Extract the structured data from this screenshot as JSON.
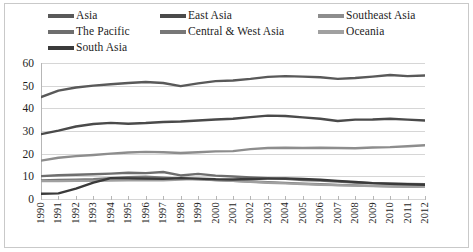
{
  "legend": {
    "position": "top",
    "items": [
      {
        "label": "Asia",
        "color": "#595959"
      },
      {
        "label": "East Asia",
        "color": "#4a4a4a"
      },
      {
        "label": "Southeast Asia",
        "color": "#8d8d8d"
      },
      {
        "label": "The Pacific",
        "color": "#6e6e6e"
      },
      {
        "label": "Central & West Asia",
        "color": "#777777"
      },
      {
        "label": "Oceania",
        "color": "#a0a0a0"
      },
      {
        "label": "South Asia",
        "color": "#3a3a3a"
      }
    ]
  },
  "axes": {
    "y_ticks": [
      "0",
      "10",
      "20",
      "30",
      "40",
      "50",
      "60"
    ],
    "x_ticks": [
      "1990",
      "1991",
      "1992",
      "1993",
      "1994",
      "1995",
      "1996",
      "1997",
      "1998",
      "1999",
      "2000",
      "2001",
      "2002",
      "2003",
      "2004",
      "2005",
      "2006",
      "2007",
      "2008",
      "2009",
      "2010",
      "2011",
      "2012"
    ]
  },
  "chart_data": {
    "type": "line",
    "title": "",
    "subtitle": "",
    "xlabel": "",
    "ylabel": "",
    "xlim": [
      1990,
      2012
    ],
    "ylim": [
      0,
      60
    ],
    "grid": true,
    "legend_position": "top",
    "categories": [
      1990,
      1991,
      1992,
      1993,
      1994,
      1995,
      1996,
      1997,
      1998,
      1999,
      2000,
      2001,
      2002,
      2003,
      2004,
      2005,
      2006,
      2007,
      2008,
      2009,
      2010,
      2011,
      2012
    ],
    "series": [
      {
        "name": "Asia",
        "color": "#595959",
        "values": [
          45.0,
          47.8,
          49.2,
          50.0,
          50.6,
          51.2,
          51.6,
          51.2,
          49.8,
          51.0,
          52.0,
          52.3,
          53.0,
          53.9,
          54.2,
          54.0,
          53.7,
          53.0,
          53.4,
          54.0,
          54.7,
          54.2,
          54.5
        ]
      },
      {
        "name": "East Asia",
        "color": "#4a4a4a",
        "values": [
          28.6,
          30.2,
          32.0,
          33.1,
          33.6,
          33.2,
          33.5,
          34.0,
          34.2,
          34.6,
          35.1,
          35.4,
          36.1,
          36.8,
          36.6,
          36.0,
          35.4,
          34.4,
          35.0,
          35.1,
          35.4,
          35.0,
          34.6
        ]
      },
      {
        "name": "Southeast Asia",
        "color": "#8d8d8d",
        "values": [
          16.9,
          18.2,
          18.9,
          19.4,
          20.0,
          20.5,
          20.8,
          20.6,
          20.3,
          20.6,
          21.0,
          21.1,
          22.0,
          22.5,
          22.6,
          22.5,
          22.6,
          22.5,
          22.4,
          22.7,
          22.9,
          23.3,
          23.7
        ]
      },
      {
        "name": "The Pacific",
        "color": "#6e6e6e",
        "values": [
          10.1,
          10.5,
          10.7,
          10.9,
          11.2,
          11.6,
          11.4,
          11.9,
          10.4,
          11.1,
          10.3,
          9.9,
          9.5,
          9.2,
          8.9,
          8.4,
          8.1,
          7.7,
          7.3,
          7.0,
          6.8,
          6.6,
          6.5
        ]
      },
      {
        "name": "Central & West Asia",
        "color": "#777777",
        "values": [
          8.2,
          8.4,
          8.5,
          8.7,
          9.2,
          9.6,
          9.8,
          9.4,
          9.0,
          8.7,
          8.4,
          8.0,
          7.7,
          7.4,
          7.1,
          6.8,
          6.5,
          6.2,
          6.0,
          5.8,
          5.6,
          5.5,
          5.4
        ]
      },
      {
        "name": "Oceania",
        "color": "#a0a0a0",
        "values": [
          7.9,
          7.9,
          8.0,
          8.0,
          8.1,
          8.2,
          8.4,
          8.3,
          8.6,
          8.9,
          8.4,
          8.0,
          7.6,
          7.2,
          6.9,
          6.6,
          6.3,
          6.1,
          5.9,
          5.7,
          5.6,
          5.5,
          5.4
        ]
      },
      {
        "name": "South Asia",
        "color": "#3a3a3a",
        "values": [
          2.3,
          2.5,
          4.6,
          7.2,
          9.2,
          9.1,
          9.0,
          8.9,
          9.2,
          9.0,
          8.7,
          8.6,
          8.8,
          9.0,
          9.1,
          8.8,
          8.5,
          8.0,
          7.5,
          7.0,
          6.7,
          6.5,
          6.3
        ]
      }
    ]
  }
}
